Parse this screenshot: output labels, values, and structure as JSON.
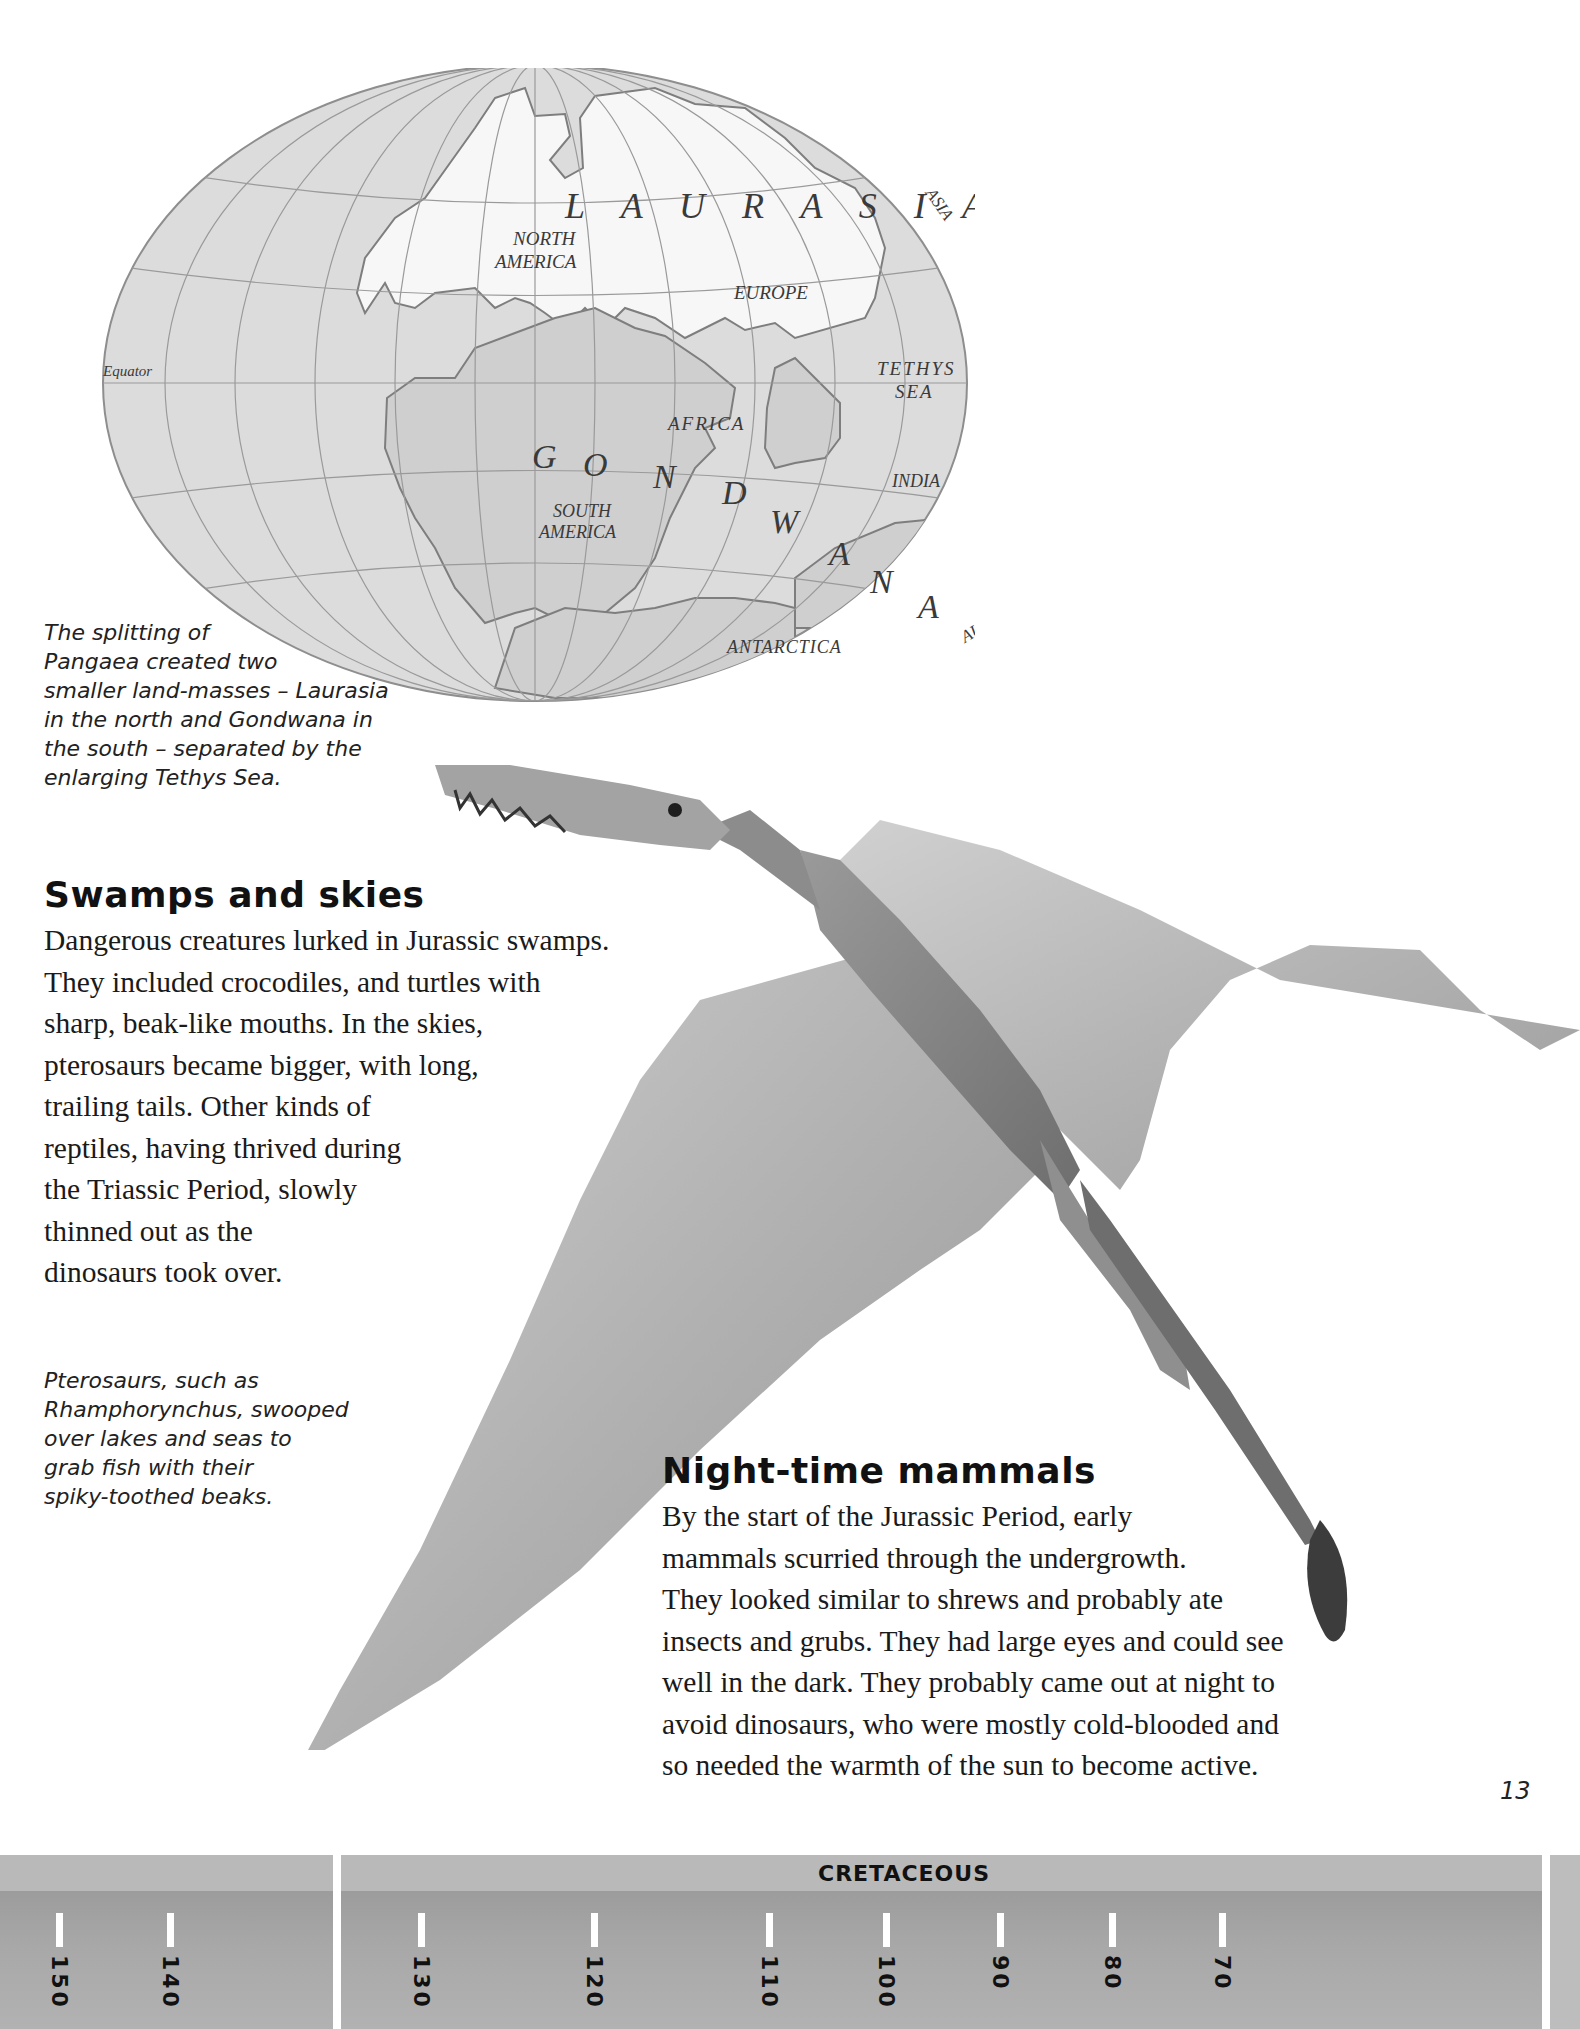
{
  "map": {
    "equator_label": "Equator",
    "landmass_labels": {
      "laurasia": "L A U R A S I A",
      "gondwana_letters": [
        "G",
        "O",
        "N",
        "D",
        "W",
        "A",
        "N",
        "A"
      ]
    },
    "region_labels": {
      "north_america_line1": "NORTH",
      "north_america_line2": "AMERICA",
      "europe": "EUROPE",
      "asia": "ASIA",
      "tethys_line1": "TETHYS",
      "tethys_line2": "SEA",
      "africa": "AFRICA",
      "india": "INDIA",
      "south_america_line1": "SOUTH",
      "south_america_line2": "AMERICA",
      "antarctica": "ANTARCTICA",
      "australia": "AUSTRALIA"
    },
    "colors": {
      "ocean": "#dcdcdc",
      "laurasia": "#f7f7f7",
      "gondwana": "#cfcfcf",
      "grid": "#9a9a9a",
      "coast": "#7e7e7e"
    }
  },
  "map_caption": "The splitting of\nPangaea created two\nsmaller land-masses – Laurasia\nin the north and Gondwana in\nthe south – separated by the\nenlarging Tethys Sea.",
  "section_swamps": {
    "heading": "Swamps and skies",
    "body": "Dangerous creatures lurked in Jurassic swamps.\nThey included crocodiles, and turtles with\nsharp, beak-like mouths. In the skies,\npterosaurs became bigger, with long,\ntrailing tails. Other kinds of\nreptiles, having thrived during\nthe Triassic Period, slowly\nthinned out as the\ndinosaurs took over."
  },
  "pterosaur_caption": "Pterosaurs, such as\nRhamphorynchus, swooped\nover lakes and seas to\ngrab fish with their\nspiky-toothed beaks.",
  "section_mammals": {
    "heading": "Night-time mammals",
    "body": "By the start of the Jurassic Period, early\nmammals scurried through the undergrowth.\nThey looked similar to shrews and probably ate\ninsects and grubs. They had large eyes and could see\nwell in the dark. They probably came out at night to\navoid dinosaurs, who were mostly cold-blooded and\nso needed the warmth of the sun to become active."
  },
  "page_number": "13",
  "timeline": {
    "era_label": "CRETACEOUS",
    "ticks": [
      "150",
      "140",
      "130",
      "120",
      "110",
      "100",
      "90",
      "80",
      "70"
    ]
  }
}
